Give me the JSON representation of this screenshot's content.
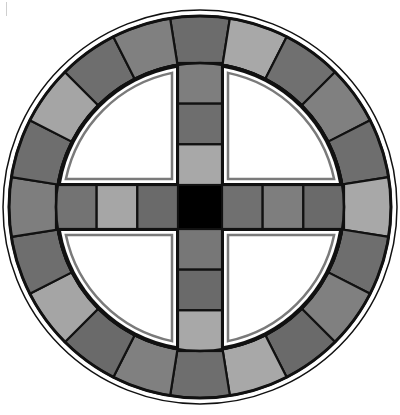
{
  "board": {
    "name": "Cross and circle race board",
    "center": [
      200,
      207
    ],
    "outer_line_radius": 197,
    "ring_outer_radius": 191,
    "ring_inner_radius": 144,
    "segment_count": 20,
    "colors": {
      "line": "#111111",
      "light": "#a8a8a8",
      "medium": "#808080",
      "dark": "#6c6c6c",
      "center": "#000000",
      "quadrant_fill": "#ffffff",
      "quadrant_border": "#7a7a7a"
    },
    "ring_segments": [
      {
        "index": 0,
        "angle": 0,
        "shade": "#6c6c6c"
      },
      {
        "index": 1,
        "angle": 18,
        "shade": "#a8a8a8"
      },
      {
        "index": 2,
        "angle": 36,
        "shade": "#707070"
      },
      {
        "index": 3,
        "angle": 54,
        "shade": "#808080"
      },
      {
        "index": 4,
        "angle": 72,
        "shade": "#6e6e6e"
      },
      {
        "index": 5,
        "angle": 90,
        "shade": "#a8a8a8"
      },
      {
        "index": 6,
        "angle": 108,
        "shade": "#6e6e6e"
      },
      {
        "index": 7,
        "angle": 126,
        "shade": "#808080"
      },
      {
        "index": 8,
        "angle": 144,
        "shade": "#6a6a6a"
      },
      {
        "index": 9,
        "angle": 162,
        "shade": "#a8a8a8"
      },
      {
        "index": 10,
        "angle": 180,
        "shade": "#6e6e6e"
      },
      {
        "index": 11,
        "angle": 198,
        "shade": "#808080"
      },
      {
        "index": 12,
        "angle": 216,
        "shade": "#6a6a6a"
      },
      {
        "index": 13,
        "angle": 234,
        "shade": "#a5a5a5"
      },
      {
        "index": 14,
        "angle": 252,
        "shade": "#6e6e6e"
      },
      {
        "index": 15,
        "angle": 270,
        "shade": "#7e7e7e"
      },
      {
        "index": 16,
        "angle": 288,
        "shade": "#6e6e6e"
      },
      {
        "index": 17,
        "angle": 306,
        "shade": "#a5a5a5"
      },
      {
        "index": 18,
        "angle": 324,
        "shade": "#6e6e6e"
      },
      {
        "index": 19,
        "angle": 342,
        "shade": "#808080"
      }
    ],
    "arms": {
      "top": [
        "#7e7e7e",
        "#6e6e6e",
        "#a8a8a8"
      ],
      "bottom": [
        "#777777",
        "#6a6a6a",
        "#a8a8a8"
      ],
      "left": [
        "#737373",
        "#a6a6a6",
        "#6a6a6a"
      ],
      "right": [
        "#707070",
        "#7e7e7e",
        "#6a6a6a"
      ]
    },
    "center_square": "#000000"
  }
}
